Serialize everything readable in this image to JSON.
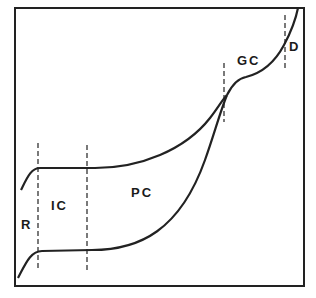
{
  "diagram": {
    "frame": {
      "stroke": "#222222"
    },
    "curves": [
      {
        "name": "upper-curve"
      },
      {
        "name": "lower-curve"
      }
    ],
    "regions": [
      {
        "id": "R",
        "label": "R"
      },
      {
        "id": "IC",
        "label": "IC"
      },
      {
        "id": "PC",
        "label": "PC"
      },
      {
        "id": "GC",
        "label": "GC"
      },
      {
        "id": "D",
        "label": "D"
      }
    ],
    "boundaries": [
      {
        "name": "r-ic-boundary"
      },
      {
        "name": "ic-pc-boundary"
      },
      {
        "name": "pc-gc-boundary"
      },
      {
        "name": "gc-d-boundary"
      }
    ]
  }
}
